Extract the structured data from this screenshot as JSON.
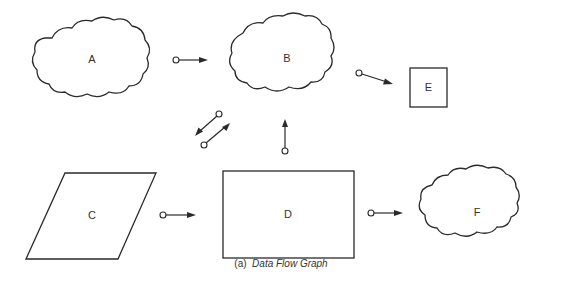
{
  "diagram": {
    "nodes": [
      {
        "id": "A",
        "label": "A",
        "shape": "cloud"
      },
      {
        "id": "B",
        "label": "B",
        "shape": "cloud"
      },
      {
        "id": "C",
        "label": "C",
        "shape": "parallelogram"
      },
      {
        "id": "D",
        "label": "D",
        "shape": "rectangle"
      },
      {
        "id": "E",
        "label": "E",
        "shape": "square"
      },
      {
        "id": "F",
        "label": "F",
        "shape": "cloud"
      }
    ],
    "edges": [
      {
        "from": "A",
        "to": "B"
      },
      {
        "from": "B",
        "to": "E"
      },
      {
        "from": "B",
        "to": "C"
      },
      {
        "from": "C",
        "to": "B"
      },
      {
        "from": "D",
        "to": "B"
      },
      {
        "from": "C",
        "to": "D"
      },
      {
        "from": "D",
        "to": "F"
      }
    ]
  },
  "caption": {
    "prefix": "(a)",
    "title": "Data Flow Graph"
  }
}
